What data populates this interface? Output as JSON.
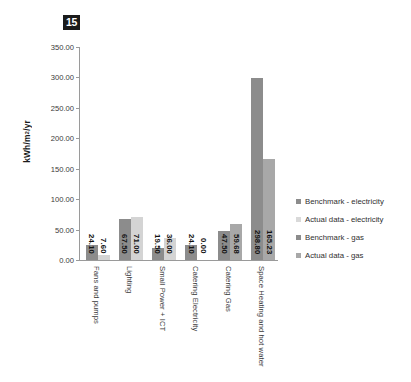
{
  "page_badge": {
    "label": "15"
  },
  "chart_data": {
    "type": "bar",
    "title": "",
    "subtitle": "",
    "xlabel": "",
    "ylabel": "kWh/m²/yr",
    "ylim": [
      0,
      350
    ],
    "ytick_step": 50,
    "ytick_labels": [
      "0.00",
      "50.00",
      "100.00",
      "150.00",
      "200.00",
      "250.00",
      "300.00",
      "350.00"
    ],
    "ytick_values": [
      0,
      50,
      100,
      150,
      200,
      250,
      300,
      350
    ],
    "grid": false,
    "legend_position": "right",
    "categories": [
      "Fans and pumps",
      "Lighting",
      "Small Power + ICT",
      "Catering Electricity",
      "Catering Gas",
      "Space Heating and hot water"
    ],
    "series": [
      {
        "name": "Benchmark - electricity",
        "color": "#8c8c8c",
        "values": [
          24.1,
          67.5,
          19.5,
          24.1,
          null,
          null
        ],
        "labels": [
          "24.10",
          "67.50",
          "19.50",
          "24.10",
          "",
          ""
        ]
      },
      {
        "name": "Actual data - electricity",
        "color": "#d4d4d4",
        "values": [
          7.6,
          71.0,
          36.0,
          0.0,
          null,
          null
        ],
        "labels": [
          "7.60",
          "71.00",
          "36.00",
          "0.00",
          "",
          ""
        ]
      },
      {
        "name": "Benchmark - gas",
        "color": "#8c8c8c",
        "values": [
          null,
          null,
          null,
          null,
          47.5,
          298.8
        ],
        "labels": [
          "",
          "",
          "",
          "",
          "47.50",
          "298.80"
        ]
      },
      {
        "name": "Actual data - gas",
        "color": "#a8a8a8",
        "values": [
          null,
          null,
          null,
          null,
          59.68,
          165.23
        ],
        "labels": [
          "",
          "",
          "",
          "",
          "59.68",
          "165.23"
        ]
      }
    ],
    "legend": [
      {
        "label": "Benchmark - electricity",
        "color": "#8c8c8c"
      },
      {
        "label": "Actual data - electricity",
        "color": "#d9d9d9"
      },
      {
        "label": "Benchmark - gas",
        "color": "#8c8c8c"
      },
      {
        "label": "Actual data - gas",
        "color": "#a8a8a8"
      }
    ]
  }
}
